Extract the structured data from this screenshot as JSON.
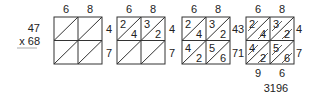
{
  "problem": {
    "multiplicand": "47",
    "multiplier": "x 68"
  },
  "column_labels": [
    "6",
    "8"
  ],
  "row_labels": [
    "4",
    "7"
  ],
  "steps": [
    {
      "name": "empty-grid",
      "cells": [
        [
          "",
          "",
          "",
          ""
        ],
        [
          "",
          "",
          "",
          ""
        ]
      ]
    },
    {
      "name": "first-row",
      "cells": [
        [
          "2",
          "4",
          "3",
          "2"
        ],
        [
          "",
          "",
          "",
          ""
        ]
      ]
    },
    {
      "name": "all-products",
      "cells": [
        [
          "2",
          "4",
          "3",
          "2"
        ],
        [
          "4",
          "2",
          "5",
          "6"
        ]
      ]
    },
    {
      "name": "diagonal-sums",
      "cells": [
        [
          "2",
          "4",
          "3",
          "2"
        ],
        [
          "4",
          "2",
          "5",
          "6"
        ]
      ],
      "left_digits": [
        "3",
        "1"
      ],
      "bottom_digits": [
        "9",
        "6"
      ],
      "result": "3196"
    }
  ],
  "colors": {
    "line": "#333333",
    "text": "#222222"
  }
}
